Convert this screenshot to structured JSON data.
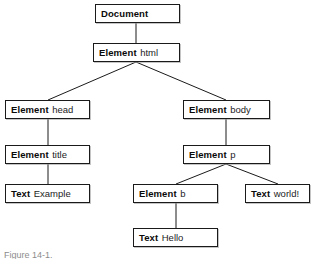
{
  "figure": {
    "kind": "dom-tree-diagram",
    "caption": "Figure 14-1.",
    "background_color": "#ffffff",
    "box_border_color": "#1a1a1a",
    "box_fill_color": "#ffffff",
    "edge_color": "#1a1a1a",
    "text_color": "#111111"
  },
  "nodes": [
    {
      "id": "document",
      "type": "Document",
      "value": "",
      "x": 95,
      "y": 4,
      "width": 85
    },
    {
      "id": "element-html",
      "type": "Element",
      "value": "html",
      "x": 93,
      "y": 43,
      "width": 87
    },
    {
      "id": "element-head",
      "type": "Element",
      "value": "head",
      "x": 5,
      "y": 100,
      "width": 85
    },
    {
      "id": "element-body",
      "type": "Element",
      "value": "body",
      "x": 183,
      "y": 100,
      "width": 87
    },
    {
      "id": "element-title",
      "type": "Element",
      "value": "title",
      "x": 5,
      "y": 145,
      "width": 85
    },
    {
      "id": "element-p",
      "type": "Element",
      "value": "p",
      "x": 183,
      "y": 145,
      "width": 87
    },
    {
      "id": "text-example",
      "type": "Text",
      "value": "Example",
      "x": 5,
      "y": 184,
      "width": 85
    },
    {
      "id": "element-b",
      "type": "Element",
      "value": "b",
      "x": 133,
      "y": 184,
      "width": 85
    },
    {
      "id": "text-world",
      "type": "Text",
      "value": "world!",
      "x": 245,
      "y": 184,
      "width": 65
    },
    {
      "id": "text-hello",
      "type": "Text",
      "value": "Hello",
      "x": 133,
      "y": 228,
      "width": 85
    }
  ],
  "edges": [
    {
      "from": "document",
      "to": "element-html",
      "x1": 136,
      "y1": 23,
      "x2": 136,
      "y2": 43
    },
    {
      "from": "element-html",
      "to": "element-head",
      "x1": 136,
      "y1": 62,
      "x2": 48,
      "y2": 100
    },
    {
      "from": "element-html",
      "to": "element-body",
      "x1": 136,
      "y1": 62,
      "x2": 226,
      "y2": 100
    },
    {
      "from": "element-head",
      "to": "element-title",
      "x1": 48,
      "y1": 119,
      "x2": 48,
      "y2": 145
    },
    {
      "from": "element-body",
      "to": "element-p",
      "x1": 226,
      "y1": 119,
      "x2": 226,
      "y2": 145
    },
    {
      "from": "element-title",
      "to": "text-example",
      "x1": 48,
      "y1": 164,
      "x2": 48,
      "y2": 184
    },
    {
      "from": "element-p",
      "to": "element-b",
      "x1": 226,
      "y1": 164,
      "x2": 176,
      "y2": 184
    },
    {
      "from": "element-p",
      "to": "text-world",
      "x1": 226,
      "y1": 164,
      "x2": 278,
      "y2": 184
    },
    {
      "from": "element-b",
      "to": "text-hello",
      "x1": 176,
      "y1": 203,
      "x2": 176,
      "y2": 228
    }
  ]
}
